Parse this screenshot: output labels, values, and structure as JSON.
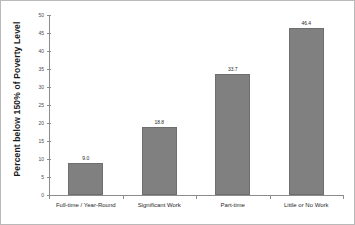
{
  "chart_data": {
    "type": "bar",
    "title": "",
    "subtitle": "",
    "xlabel": "",
    "ylabel": "Percent below 150% of Poverty Level",
    "ylim": [
      0,
      50
    ],
    "ytick_step": 5,
    "yticks": [
      "0",
      "5",
      "10",
      "15",
      "20",
      "25",
      "30",
      "35",
      "40",
      "45",
      "50"
    ],
    "grid": false,
    "legend": false,
    "categories": [
      "Full-time / Year-Round",
      "Significant Work",
      "Part-time",
      "Little or No Work"
    ],
    "values": [
      9.0,
      18.8,
      33.7,
      46.4
    ],
    "value_labels": [
      "9.0",
      "18.8",
      "33.7",
      "46.4"
    ],
    "bar_color": "#808080",
    "bar_edge_color": "#6e6e6e",
    "axis_color": "#8c8c8c",
    "background_color": "#ffffff",
    "border_color": "#b9b9b9"
  }
}
